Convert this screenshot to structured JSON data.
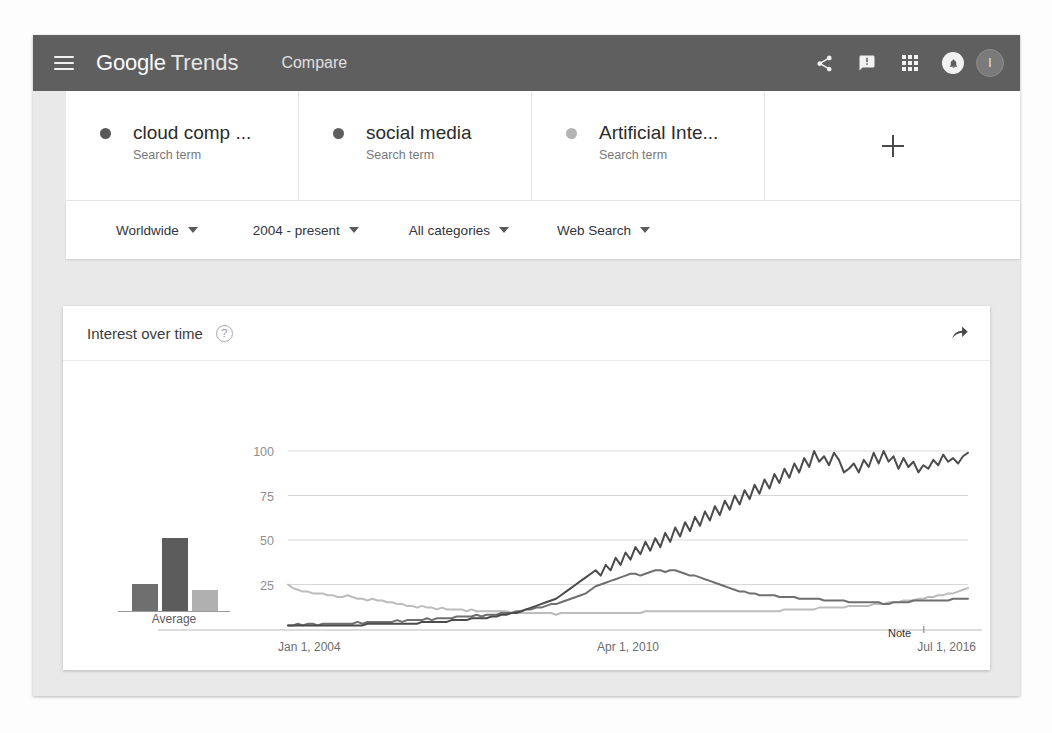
{
  "header": {
    "menu_icon": "hamburger-menu-icon",
    "brand_google": "Google",
    "brand_trends": "Trends",
    "nav_compare": "Compare",
    "icons": [
      "share-icon",
      "feedback-icon",
      "apps-grid-icon",
      "notifications-bell-icon"
    ],
    "avatar_initial": "I",
    "background": "#5f5f5f"
  },
  "terms": [
    {
      "name": "cloud comp  ...",
      "type": "Search term",
      "color": "#585858"
    },
    {
      "name": "social media",
      "type": "Search term",
      "color": "#5e5e5e"
    },
    {
      "name": "Artificial Inte...",
      "type": "Search term",
      "color": "#b4b4b4"
    }
  ],
  "add_term_label": "+",
  "filters": [
    {
      "label": "Worldwide"
    },
    {
      "label": "2004 - present"
    },
    {
      "label": "All categories"
    },
    {
      "label": "Web Search"
    }
  ],
  "card": {
    "title": "Interest over time",
    "help_icon": "help-question-icon",
    "embed_icon": "embed-share-arrow-icon"
  },
  "average": {
    "label": "Average",
    "values": [
      18,
      48,
      12
    ],
    "colors": [
      "#6f6f6f",
      "#5c5c5c",
      "#b0b0b0"
    ]
  },
  "annotation": {
    "label": "Note"
  },
  "chart_data": {
    "type": "line",
    "title": "Interest over time",
    "xlabel": "",
    "ylabel": "",
    "ylim": [
      0,
      100
    ],
    "yticks": [
      25,
      50,
      75,
      100
    ],
    "grid": true,
    "legend": "none",
    "x_tick_labels": [
      "Jan 1, 2004",
      "Apr 1, 2010",
      "Jul 1, 2016"
    ],
    "x_tick_positions": [
      0,
      0.5,
      1.0
    ],
    "series": [
      {
        "name": "cloud comp  ...",
        "color": "#6f6f6f",
        "values": [
          2,
          2,
          3,
          2,
          3,
          3,
          2,
          3,
          3,
          3,
          3,
          3,
          3,
          3,
          4,
          3,
          4,
          4,
          4,
          4,
          4,
          4,
          5,
          4,
          5,
          5,
          5,
          5,
          6,
          5,
          6,
          6,
          6,
          6,
          7,
          7,
          7,
          7,
          8,
          7,
          8,
          8,
          8,
          9,
          9,
          9,
          10,
          10,
          11,
          11,
          12,
          12,
          13,
          14,
          14,
          15,
          16,
          17,
          18,
          19,
          20,
          22,
          24,
          25,
          26,
          27,
          28,
          29,
          30,
          31,
          31,
          30,
          31,
          32,
          33,
          33,
          32,
          33,
          33,
          32,
          31,
          30,
          30,
          29,
          28,
          27,
          26,
          25,
          24,
          23,
          22,
          21,
          21,
          20,
          20,
          19,
          19,
          19,
          19,
          18,
          18,
          18,
          18,
          17,
          17,
          17,
          17,
          17,
          16,
          16,
          16,
          16,
          16,
          15,
          15,
          15,
          15,
          15,
          15,
          15,
          14,
          14,
          15,
          15,
          15,
          15,
          16,
          16,
          16,
          16,
          16,
          16,
          16,
          16,
          17,
          17,
          17,
          17
        ]
      },
      {
        "name": "social media",
        "color": "#4b4b4b",
        "values": [
          2,
          2,
          2,
          2,
          2,
          2,
          2,
          2,
          2,
          2,
          2,
          2,
          2,
          2,
          2,
          2,
          3,
          3,
          3,
          3,
          3,
          3,
          3,
          3,
          3,
          3,
          3,
          4,
          4,
          4,
          4,
          4,
          4,
          5,
          5,
          5,
          5,
          6,
          6,
          6,
          6,
          7,
          7,
          8,
          8,
          9,
          9,
          10,
          11,
          12,
          13,
          14,
          15,
          16,
          17,
          19,
          21,
          23,
          25,
          27,
          29,
          31,
          33,
          30,
          36,
          33,
          40,
          36,
          43,
          39,
          46,
          42,
          49,
          44,
          51,
          46,
          54,
          49,
          57,
          52,
          60,
          55,
          63,
          58,
          66,
          61,
          69,
          64,
          72,
          67,
          75,
          70,
          78,
          73,
          81,
          76,
          84,
          79,
          87,
          82,
          90,
          85,
          93,
          88,
          96,
          91,
          100,
          94,
          97,
          92,
          99,
          95,
          88,
          90,
          93,
          88,
          95,
          91,
          99,
          93,
          100,
          94,
          97,
          90,
          96,
          91,
          94,
          88,
          92,
          90,
          95,
          92,
          98,
          94,
          96,
          93,
          97,
          99
        ]
      },
      {
        "name": "Artificial Inte...",
        "color": "#bcbcbc",
        "values": [
          25,
          23,
          22,
          21,
          21,
          20,
          20,
          20,
          19,
          19,
          18,
          18,
          19,
          18,
          17,
          17,
          16,
          17,
          16,
          16,
          15,
          15,
          14,
          14,
          13,
          13,
          12,
          13,
          12,
          12,
          11,
          12,
          11,
          11,
          11,
          11,
          10,
          11,
          10,
          10,
          10,
          10,
          10,
          10,
          10,
          9,
          9,
          9,
          9,
          9,
          9,
          9,
          9,
          9,
          8,
          9,
          9,
          9,
          9,
          9,
          9,
          9,
          9,
          9,
          9,
          9,
          9,
          9,
          9,
          9,
          9,
          9,
          10,
          10,
          10,
          10,
          10,
          10,
          10,
          10,
          10,
          10,
          10,
          10,
          10,
          10,
          10,
          10,
          10,
          10,
          10,
          10,
          10,
          10,
          10,
          10,
          10,
          10,
          10,
          10,
          11,
          11,
          11,
          11,
          11,
          11,
          11,
          12,
          12,
          12,
          12,
          12,
          12,
          13,
          13,
          13,
          13,
          13,
          14,
          14,
          14,
          15,
          15,
          15,
          16,
          16,
          16,
          17,
          17,
          18,
          18,
          19,
          19,
          20,
          20,
          21,
          22,
          23
        ]
      }
    ]
  }
}
